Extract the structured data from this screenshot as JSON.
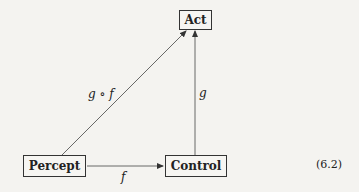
{
  "diagram": {
    "nodes": {
      "act": "Act",
      "percept": "Percept",
      "control": "Control"
    },
    "edges": {
      "percept_to_control": "f",
      "control_to_act": "g",
      "percept_to_act": "g ∘ f"
    },
    "equation_number": "(6.2)",
    "colors": {
      "background": "#f4f3f0",
      "ink": "#222222"
    }
  }
}
